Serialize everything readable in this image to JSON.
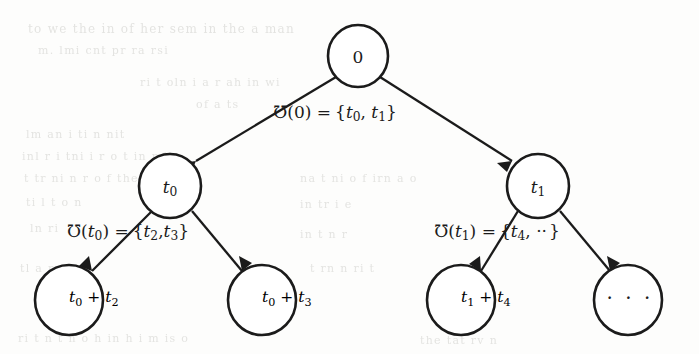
{
  "figure": {
    "type": "tree-diagram",
    "colors": {
      "stroke": "#1b1b1b",
      "node_fill": "#ffffff",
      "background": "#fdfdfc",
      "ghost_text": "#cfcfcb"
    }
  },
  "nodes": {
    "root": {
      "id": "root",
      "label": "0",
      "label_plain": "0",
      "cx": 358,
      "cy": 56,
      "r": 30
    },
    "level1_left": {
      "id": "t0",
      "label_base": "t",
      "label_sub": "0",
      "label_plain": "t0",
      "cx": 170,
      "cy": 186,
      "r": 31
    },
    "level1_right": {
      "id": "t1",
      "label_base": "t",
      "label_sub": "1",
      "label_plain": "t1",
      "cx": 538,
      "cy": 186,
      "r": 31
    },
    "leaf_1": {
      "id": "t0-plus-t2",
      "label_plain": "t0 + t2",
      "parts": [
        {
          "base": "t",
          "sub": "0"
        },
        {
          "op": " + "
        },
        {
          "base": "t",
          "sub": "2"
        }
      ],
      "cx": 69,
      "cy": 300,
      "r": 34
    },
    "leaf_2": {
      "id": "t0-plus-t3",
      "label_plain": "t0 + t3",
      "parts": [
        {
          "base": "t",
          "sub": "0"
        },
        {
          "op": " + "
        },
        {
          "base": "t",
          "sub": "3"
        }
      ],
      "cx": 262,
      "cy": 300,
      "r": 34
    },
    "leaf_3": {
      "id": "t1-plus-t4",
      "label_plain": "t1 + t4",
      "parts": [
        {
          "base": "t",
          "sub": "1"
        },
        {
          "op": " + "
        },
        {
          "base": "t",
          "sub": "4"
        }
      ],
      "cx": 461,
      "cy": 300,
      "r": 34
    },
    "leaf_4": {
      "id": "ellipsis",
      "label_plain": "· · ·",
      "label": "· · ·",
      "cx": 628,
      "cy": 300,
      "r": 34
    }
  },
  "edge_labels": {
    "root_label": {
      "id": "successors-of-0",
      "plain": "℧(0) = {t0, t1}",
      "operator": "℧",
      "argument": "0",
      "equals": "=",
      "set_open": "{",
      "members": [
        {
          "base": "t",
          "sub": "0"
        },
        {
          "base": "t",
          "sub": "1"
        }
      ],
      "set_close": "}",
      "x": 335,
      "y": 113
    },
    "left_label": {
      "id": "successors-of-t0",
      "plain": "℧(t0) = {t2, t3}",
      "operator": "℧",
      "argument_base": "t",
      "argument_sub": "0",
      "equals": "=",
      "set_open": "{",
      "members": [
        {
          "base": "t",
          "sub": "2"
        },
        {
          "base": "t",
          "sub": "3"
        }
      ],
      "set_close": "}",
      "x": 128,
      "y": 232
    },
    "right_label": {
      "id": "successors-of-t1",
      "plain": "℧(t1) = {t4, ··}",
      "operator": "℧",
      "argument_base": "t",
      "argument_sub": "1",
      "equals": "=",
      "set_open": "{",
      "members": [
        {
          "base": "t",
          "sub": "4"
        }
      ],
      "ellipsis": "··",
      "set_close": "}",
      "x": 497,
      "y": 232
    }
  },
  "edges": [
    {
      "id": "root-to-t0",
      "from": "root",
      "to": "level1_left",
      "x1": 336,
      "y1": 77,
      "x2": 191,
      "y2": 165
    },
    {
      "id": "root-to-t1",
      "from": "root",
      "to": "level1_right",
      "x1": 380,
      "y1": 77,
      "x2": 517,
      "y2": 165
    },
    {
      "id": "t0-to-leaf1",
      "from": "level1_left",
      "to": "leaf_1",
      "x1": 152,
      "y1": 211,
      "x2": 90,
      "y2": 272
    },
    {
      "id": "t0-to-leaf2",
      "from": "level1_left",
      "to": "leaf_2",
      "x1": 192,
      "y1": 211,
      "x2": 244,
      "y2": 272
    },
    {
      "id": "t1-to-leaf3",
      "from": "level1_right",
      "to": "leaf_3",
      "x1": 518,
      "y1": 211,
      "x2": 480,
      "y2": 272
    },
    {
      "id": "t1-to-leaf4",
      "from": "level1_right",
      "to": "leaf_4",
      "x1": 560,
      "y1": 211,
      "x2": 608,
      "y2": 272
    }
  ],
  "ghost_lines": [
    {
      "text": "to we the in of her sem  in  the a man",
      "x": 28,
      "y": 22,
      "size": 12
    },
    {
      "text": "m. lmi  cnt pr ra  rsi",
      "x": 38,
      "y": 44,
      "size": 11
    },
    {
      "text": "ri t  oln  i a  r ah  in  wi",
      "x": 140,
      "y": 76,
      "size": 11
    },
    {
      "text": "of  a ts",
      "x": 196,
      "y": 98,
      "size": 11
    },
    {
      "text": "lm  an i ti  n  nit",
      "x": 26,
      "y": 128,
      "size": 11
    },
    {
      "text": "inl  r i  tni i r  o t in  mit",
      "x": 22,
      "y": 150,
      "size": 11
    },
    {
      "text": "t  tr  ni n r o f the  i ali",
      "x": 24,
      "y": 172,
      "size": 11
    },
    {
      "text": "na  t ni  o  f  irn a o",
      "x": 300,
      "y": 172,
      "size": 11
    },
    {
      "text": "ti  l t   o  n",
      "x": 26,
      "y": 196,
      "size": 11
    },
    {
      "text": "in  tr i  e",
      "x": 300,
      "y": 198,
      "size": 11
    },
    {
      "text": "ln  ri",
      "x": 30,
      "y": 222,
      "size": 11
    },
    {
      "text": "in  t n r",
      "x": 300,
      "y": 228,
      "size": 11
    },
    {
      "text": "t  rn  n  ri  t",
      "x": 310,
      "y": 262,
      "size": 11
    },
    {
      "text": "tl  a  r",
      "x": 20,
      "y": 262,
      "size": 11
    },
    {
      "text": "ri  t n t  n  o h  in  h  i  m  is o",
      "x": 18,
      "y": 332,
      "size": 11
    },
    {
      "text": "the  tat  rv n",
      "x": 420,
      "y": 334,
      "size": 11
    }
  ]
}
